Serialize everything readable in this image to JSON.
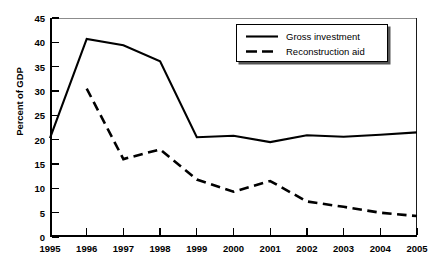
{
  "chart_data": {
    "type": "line",
    "title": "",
    "xlabel": "",
    "ylabel": "Percent of GDP",
    "x": [
      1995,
      1996,
      1997,
      1998,
      1999,
      2000,
      2001,
      2002,
      2003,
      2004,
      2005
    ],
    "xtick_labels": [
      "1995",
      "1996",
      "1997",
      "1998",
      "1999",
      "2000",
      "2001",
      "2002",
      "2003",
      "2004",
      "2005"
    ],
    "xlim": [
      1995,
      2005
    ],
    "ylim": [
      0,
      45
    ],
    "ytick_values": [
      0,
      5,
      10,
      15,
      20,
      25,
      30,
      35,
      40,
      45
    ],
    "ytick_labels": [
      "0",
      "5",
      "10",
      "15",
      "20",
      "25",
      "30",
      "35",
      "40",
      "45"
    ],
    "grid": false,
    "legend_position": "top-right",
    "series": [
      {
        "name": "Gross investment",
        "style": "solid",
        "color": "#000000",
        "x": [
          1995,
          1996,
          1997,
          1998,
          1999,
          2000,
          2001,
          2002,
          2003,
          2004,
          2005
        ],
        "values": [
          20.3,
          40.7,
          39.4,
          36.1,
          20.5,
          20.8,
          19.5,
          20.9,
          20.6,
          21.0,
          21.5
        ]
      },
      {
        "name": "Reconstruction aid",
        "style": "dashed",
        "color": "#000000",
        "x": [
          1996,
          1997,
          1998,
          1999,
          2000,
          2001,
          2002,
          2003,
          2004,
          2005
        ],
        "values": [
          30.5,
          16.0,
          18.0,
          11.8,
          9.3,
          11.5,
          7.3,
          6.2,
          5.0,
          4.3
        ]
      }
    ]
  },
  "legend": {
    "items": [
      {
        "label": "Gross investment",
        "style": "solid"
      },
      {
        "label": "Reconstruction aid",
        "style": "dashed"
      }
    ]
  }
}
